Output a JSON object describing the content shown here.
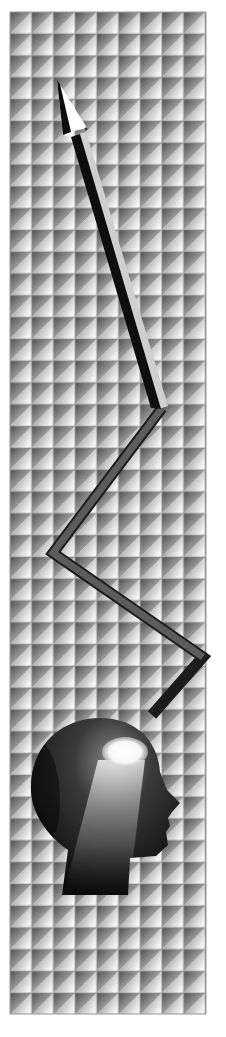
{
  "illustration": {
    "title": "Rising zigzag arrow from head silhouette",
    "background_color": "#ffffff",
    "grid": {
      "x": 10,
      "y": 12,
      "columns": 9,
      "rows": 46,
      "tile_width": 21.7,
      "tile_height": 21.8,
      "tile_dark": "#5a5a5a",
      "tile_light": "#ffffff",
      "line_color": "#9a9a9a"
    },
    "arrow": {
      "tip": [
        57,
        80
      ],
      "path_points": [
        [
          152,
          715
        ],
        [
          203,
          657
        ],
        [
          53,
          553
        ],
        [
          162,
          408
        ],
        [
          78,
          132
        ]
      ],
      "dark_color": "#111111",
      "mid_color": "#555555",
      "light_color": "#cfcfcf",
      "head_color": "#ffffff"
    },
    "head": {
      "fill_dark": "#0d0d0d",
      "fill_mid": "#3a3a3a",
      "glow_color": "#ffffff",
      "glow_center": [
        125,
        755
      ]
    }
  }
}
